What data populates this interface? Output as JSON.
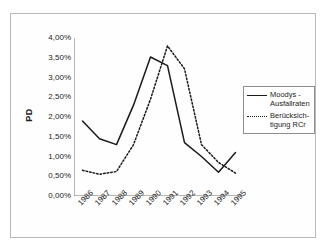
{
  "chart_data": {
    "type": "line",
    "title": "",
    "xlabel": "",
    "ylabel": "PD",
    "ylim": [
      0,
      4
    ],
    "ytick_labels": [
      "4,00%",
      "3,50%",
      "3,00%",
      "2,50%",
      "2,00%",
      "1,50%",
      "1,00%",
      "0,50%",
      "0,00%"
    ],
    "ytick_values": [
      4.0,
      3.5,
      3.0,
      2.5,
      2.0,
      1.5,
      1.0,
      0.5,
      0.0
    ],
    "categories": [
      "1986",
      "1987",
      "1988",
      "1989",
      "1990",
      "1991",
      "1992",
      "1993",
      "1994",
      "1995"
    ],
    "grid": false,
    "legend_position": "right",
    "series": [
      {
        "name": "Moodys -\nAusfallraten",
        "style": "solid",
        "color": "#1a1a1a",
        "values": [
          1.9,
          1.45,
          1.3,
          2.3,
          3.52,
          3.3,
          1.35,
          1.0,
          0.6,
          1.1
        ]
      },
      {
        "name": "Berücksich-\ntigung RCr",
        "style": "dotted",
        "color": "#1a1a1a",
        "values": [
          0.65,
          0.55,
          0.62,
          1.3,
          2.45,
          3.8,
          3.22,
          1.3,
          0.85,
          0.58
        ]
      }
    ]
  },
  "legend": {
    "entries": [
      {
        "label": "Moodys -\nAusfallraten",
        "sample": "solid-line-sample"
      },
      {
        "label": "Berücksich-\ntigung RCr",
        "sample": "dotted-line-sample"
      }
    ]
  },
  "axis": {
    "y_title": "PD"
  }
}
